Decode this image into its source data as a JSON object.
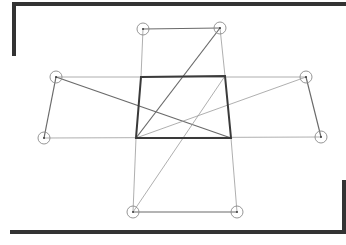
{
  "canvas": {
    "width": 346,
    "height": 245,
    "background": "#ffffff"
  },
  "colors": {
    "frame": "#333333",
    "thick_line": "#3a3a3a",
    "medium_line": "#6a6a6a",
    "thin_line": "#9a9a9a",
    "circle": "#8a8a8a"
  },
  "frame": {
    "top_left_bracket": [
      [
        14,
        54
      ],
      [
        14,
        4
      ],
      [
        346,
        4
      ]
    ],
    "bottom_right_bracket": [
      [
        12,
        232
      ],
      [
        344,
        232
      ],
      [
        344,
        182
      ]
    ],
    "stroke_width": 4
  },
  "central_square": {
    "label": "square",
    "corners": [
      [
        141,
        77
      ],
      [
        225,
        76
      ],
      [
        231,
        138
      ],
      [
        136,
        138
      ]
    ]
  },
  "points": [
    {
      "id": "top-left",
      "x": 143,
      "y": 29
    },
    {
      "id": "top-right",
      "x": 220,
      "y": 28
    },
    {
      "id": "left-top",
      "x": 56,
      "y": 77
    },
    {
      "id": "left-bottom",
      "x": 44,
      "y": 138
    },
    {
      "id": "right-top",
      "x": 306,
      "y": 77
    },
    {
      "id": "right-bottom",
      "x": 321,
      "y": 137
    },
    {
      "id": "bottom-left",
      "x": 133,
      "y": 212
    },
    {
      "id": "bottom-right",
      "x": 237,
      "y": 212
    }
  ],
  "segments": [
    {
      "from": [
        143,
        29
      ],
      "to": [
        220,
        28
      ],
      "weight": "medium"
    },
    {
      "from": [
        143,
        29
      ],
      "to": [
        141,
        77
      ],
      "weight": "thin"
    },
    {
      "from": [
        220,
        28
      ],
      "to": [
        225,
        76
      ],
      "weight": "thin"
    },
    {
      "from": [
        220,
        28
      ],
      "to": [
        136,
        138
      ],
      "weight": "medium"
    },
    {
      "from": [
        56,
        77
      ],
      "to": [
        44,
        138
      ],
      "weight": "medium"
    },
    {
      "from": [
        56,
        77
      ],
      "to": [
        306,
        77
      ],
      "weight": "thin"
    },
    {
      "from": [
        44,
        138
      ],
      "to": [
        321,
        137
      ],
      "weight": "thin"
    },
    {
      "from": [
        56,
        77
      ],
      "to": [
        231,
        138
      ],
      "weight": "medium"
    },
    {
      "from": [
        306,
        77
      ],
      "to": [
        321,
        137
      ],
      "weight": "medium"
    },
    {
      "from": [
        306,
        77
      ],
      "to": [
        136,
        138
      ],
      "weight": "thin"
    },
    {
      "from": [
        136,
        138
      ],
      "to": [
        133,
        212
      ],
      "weight": "thin"
    },
    {
      "from": [
        231,
        138
      ],
      "to": [
        237,
        212
      ],
      "weight": "thin"
    },
    {
      "from": [
        133,
        212
      ],
      "to": [
        237,
        212
      ],
      "weight": "medium"
    },
    {
      "from": [
        133,
        212
      ],
      "to": [
        225,
        76
      ],
      "weight": "thin"
    }
  ],
  "circle_radius": 6
}
